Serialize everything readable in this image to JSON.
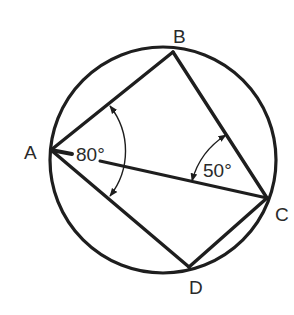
{
  "diagram": {
    "type": "cyclic-quadrilateral",
    "colors": {
      "stroke": "#1e1e1e",
      "text": "#2a2a2a",
      "background": "#ffffff"
    },
    "circle": {
      "cx": 163,
      "cy": 160,
      "r": 113
    },
    "points": {
      "A": {
        "label": "A",
        "x": 51,
        "y": 150
      },
      "B": {
        "label": "B",
        "x": 173,
        "y": 52
      },
      "C": {
        "label": "C",
        "x": 267,
        "y": 198
      },
      "D": {
        "label": "D",
        "x": 189,
        "y": 267
      }
    },
    "segments": [
      "AB",
      "BC",
      "CD",
      "DA",
      "AC"
    ],
    "angles": [
      {
        "vertex": "A",
        "between": [
          "AB",
          "AD"
        ],
        "label": "80°"
      },
      {
        "vertex": "C",
        "between": [
          "CB",
          "CA"
        ],
        "label": "50°"
      }
    ]
  }
}
